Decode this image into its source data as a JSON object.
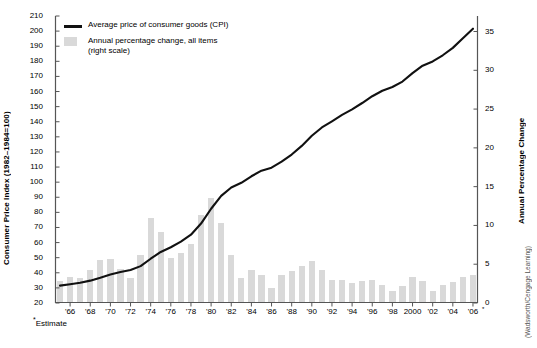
{
  "chart_data": {
    "type": "bar",
    "title": "",
    "xlabel": "",
    "ylabel": "Consumer Price Index (1982–1984=100)",
    "y2label": "Annual Percentage Change",
    "grid": false,
    "legend_position": "top-left",
    "ylim": [
      20,
      210
    ],
    "y2lim": [
      0,
      37
    ],
    "xlim": [
      1965,
      2006
    ],
    "ytick_labels": [
      "210",
      "200",
      "190",
      "180",
      "170",
      "160",
      "150",
      "140",
      "130",
      "120",
      "110",
      "100",
      "90",
      "80",
      "70",
      "60",
      "50",
      "40",
      "30",
      "20"
    ],
    "ytick_values": [
      210,
      200,
      190,
      180,
      170,
      160,
      150,
      140,
      130,
      120,
      110,
      100,
      90,
      80,
      70,
      60,
      50,
      40,
      30,
      20
    ],
    "y2tick_labels": [
      "35",
      "30",
      "25",
      "20",
      "15",
      "10",
      "5",
      "0"
    ],
    "y2tick_values": [
      35,
      30,
      25,
      20,
      15,
      10,
      5,
      0
    ],
    "xtick_labels": [
      "'66",
      "'68",
      "'70",
      "'72",
      "'74",
      "'76",
      "'78",
      "'80",
      "'82",
      "'84",
      "'86",
      "'88",
      "'90",
      "'92",
      "'94",
      "'96",
      "'98",
      "2000",
      "'02",
      "'04",
      "'06"
    ],
    "xtick_values": [
      1966,
      1968,
      1970,
      1972,
      1974,
      1976,
      1978,
      1980,
      1982,
      1984,
      1986,
      1988,
      1990,
      1992,
      1994,
      1996,
      1998,
      2000,
      2002,
      2004,
      2006
    ],
    "x": [
      1965,
      1966,
      1967,
      1968,
      1969,
      1970,
      1971,
      1972,
      1973,
      1974,
      1975,
      1976,
      1977,
      1978,
      1979,
      1980,
      1981,
      1982,
      1983,
      1984,
      1985,
      1986,
      1987,
      1988,
      1989,
      1990,
      1991,
      1992,
      1993,
      1994,
      1995,
      1996,
      1997,
      1998,
      1999,
      2000,
      2001,
      2002,
      2003,
      2004,
      2005,
      2006
    ],
    "series": [
      {
        "name": "Average price of consumer goods (CPI)",
        "type": "line",
        "axis": "left",
        "color": "#111111",
        "values": [
          31.5,
          32.4,
          33.4,
          34.8,
          36.7,
          38.8,
          40.5,
          41.8,
          44.4,
          49.3,
          53.8,
          56.9,
          60.6,
          65.2,
          72.6,
          82.4,
          90.9,
          96.5,
          99.6,
          103.9,
          107.6,
          109.6,
          113.6,
          118.3,
          124.0,
          130.7,
          136.2,
          140.3,
          144.5,
          148.2,
          152.4,
          156.9,
          160.5,
          163.0,
          166.6,
          172.2,
          177.1,
          179.9,
          184.0,
          188.9,
          195.3,
          201.6
        ]
      },
      {
        "name": "Annual percentage change, all items (right scale)",
        "type": "bar",
        "axis": "right",
        "color": "#d9d9d9",
        "values": [
          2.8,
          3.4,
          3.2,
          4.2,
          5.5,
          5.7,
          4.4,
          3.2,
          6.2,
          11.0,
          9.1,
          5.8,
          6.5,
          7.6,
          11.3,
          13.5,
          10.3,
          6.2,
          3.2,
          4.3,
          3.6,
          1.9,
          3.6,
          4.1,
          4.8,
          5.4,
          4.2,
          3.0,
          3.0,
          2.6,
          2.8,
          3.0,
          2.3,
          1.6,
          2.2,
          3.4,
          2.8,
          1.6,
          2.3,
          2.7,
          3.4,
          3.6
        ]
      }
    ],
    "annotations": [
      "*Estimate"
    ]
  },
  "axes": {
    "left_title": "Consumer Price Index (1982–1984=100)",
    "right_title": "Annual Percentage Change"
  },
  "legend": {
    "items": [
      {
        "marker": "line",
        "label": "Average price of consumer goods (CPI)",
        "sublabel": ""
      },
      {
        "marker": "box",
        "label": "Annual percentage change, all items",
        "sublabel": "(right scale)"
      }
    ]
  },
  "footnote": {
    "star": "*",
    "text": "Estimate"
  },
  "credit": {
    "text": "(Wadsworth/Cengage Learning)"
  },
  "colors": {
    "line": "#111111",
    "bar": "#d9d9d9",
    "axis": "#555555",
    "text": "#000000"
  }
}
